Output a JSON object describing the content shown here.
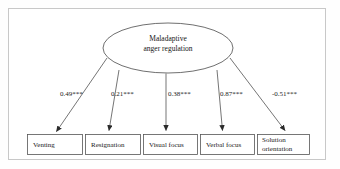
{
  "figure": {
    "type": "path-diagram",
    "latent_variable": {
      "id": "maladaptive-anger-regulation",
      "label": "Maladaptive\nanger regulation",
      "shape": "ellipse"
    },
    "indicators": [
      {
        "id": "venting",
        "label": "Venting",
        "coefficient": "0.49***"
      },
      {
        "id": "resignation",
        "label": "Resignation",
        "coefficient": "0.21***"
      },
      {
        "id": "visual-focus",
        "label": "Visual focus",
        "coefficient": "0.38***"
      },
      {
        "id": "verbal-focus",
        "label": "Verbal focus",
        "coefficient": "0.87***"
      },
      {
        "id": "solution-orientation",
        "label": "Solution\norientation",
        "coefficient": "-0.51***"
      }
    ],
    "colors": {
      "stroke": "#3a3a3a",
      "frame": "#c8c8c8",
      "text": "#1a1a1a",
      "background": "#ffffff"
    }
  }
}
